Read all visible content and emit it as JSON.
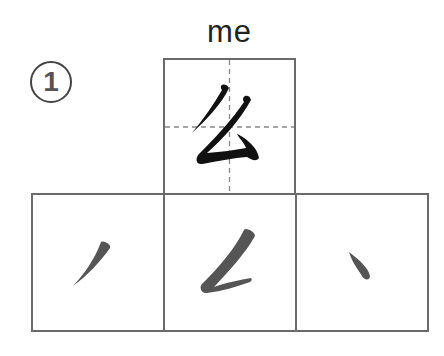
{
  "lesson": {
    "number": "1",
    "pinyin": "me",
    "character": "么",
    "strokes": [
      {
        "index": 1,
        "name": "piě",
        "glyph": "丿"
      },
      {
        "index": 2,
        "name": "piě-diǎn",
        "glyph": "𠃋"
      },
      {
        "index": 3,
        "name": "diǎn",
        "glyph": "丶"
      }
    ]
  },
  "colors": {
    "grid_border": "#6a6a6a",
    "guide_line": "#888888",
    "main_char": "#111111",
    "stroke": "#555555"
  }
}
